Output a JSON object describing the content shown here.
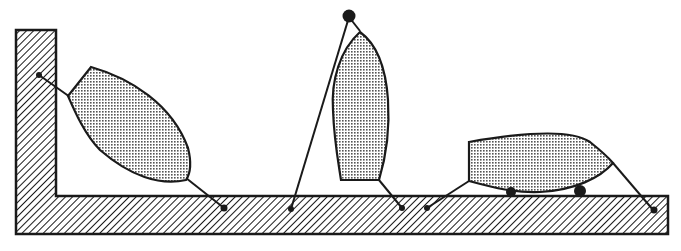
{
  "diagram": {
    "colors": {
      "ink": "#1a1a1a",
      "background": "#ffffff",
      "hull_fill": "#d8d8d8"
    },
    "elements": [
      {
        "id": "dock",
        "label": "L-shaped dock (hatched)",
        "kind": "structure"
      },
      {
        "id": "boat-1",
        "label": "Boat tilted against wall, bow up",
        "kind": "boat"
      },
      {
        "id": "boat-2",
        "label": "Boat standing on stern, bow up, masthead float",
        "kind": "boat"
      },
      {
        "id": "boat-3",
        "label": "Boat resting on fenders on dock",
        "kind": "boat"
      }
    ]
  }
}
